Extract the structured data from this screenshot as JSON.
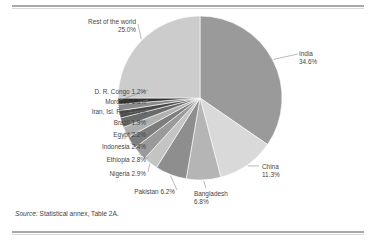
{
  "figure": {
    "source_prefix": "Source:",
    "source_text": " Statistical annex, Table 2A."
  },
  "chart_data": {
    "type": "pie",
    "title": "",
    "subtitle": "",
    "xlabel": "",
    "ylabel": "",
    "units": "percent",
    "legend_position": "none",
    "grid": false,
    "label_format": "{name} {value}%",
    "start_angle_deg": 0,
    "direction": "clockwise",
    "categories": [
      "India",
      "China",
      "Bangladesh",
      "Pakistan",
      "Nigeria",
      "Ethiopia",
      "Indonesia",
      "Egypt",
      "Brazil",
      "Iran, Isl. Rep.",
      "Morocco",
      "D. R. Congo",
      "Rest of the world"
    ],
    "values": [
      34.6,
      11.3,
      6.8,
      6.2,
      2.9,
      2.8,
      2.4,
      2.2,
      1.9,
      1.4,
      1.3,
      1.2,
      25.0
    ],
    "colors": [
      "#9a9a9a",
      "#d9d9d9",
      "#b5b5b5",
      "#8e8e8e",
      "#c4c4c4",
      "#9a9a9a",
      "#7d7d7d",
      "#b0b0b0",
      "#6a6a6a",
      "#4a4a4a",
      "#8a8a8a",
      "#2e2e2e",
      "#cccccc"
    ],
    "slice_labels": [
      {
        "name": "India",
        "value": "34.6%",
        "line1": "India",
        "line2": "34.6%"
      },
      {
        "name": "China",
        "value": "11.3%",
        "line1": "China",
        "line2": "11.3%"
      },
      {
        "name": "Bangladesh",
        "value": "6.8%",
        "line1": "Bangladesh",
        "line2": "6.8%"
      },
      {
        "name": "Pakistan",
        "value": "6.2%",
        "line1": "Pakistan 6.2%",
        "line2": ""
      },
      {
        "name": "Nigeria",
        "value": "2.9%",
        "line1": "Nigeria 2.9%",
        "line2": ""
      },
      {
        "name": "Ethiopia",
        "value": "2.8%",
        "line1": "Ethiopia 2.8%",
        "line2": ""
      },
      {
        "name": "Indonesia",
        "value": "2.4%",
        "line1": "Indonesia 2.4%",
        "line2": ""
      },
      {
        "name": "Egypt",
        "value": "2.2%",
        "line1": "Egypt 2.2%",
        "line2": ""
      },
      {
        "name": "Brazil",
        "value": "1.9%",
        "line1": "Brazil 1.9%",
        "line2": ""
      },
      {
        "name": "Iran, Isl. Rep.",
        "value": "1.4%",
        "line1": "Iran, Isl. Rep. 1.4%",
        "line2": ""
      },
      {
        "name": "Morocco",
        "value": "1.3%",
        "line1": "Morocco 1.3%",
        "line2": ""
      },
      {
        "name": "D. R. Congo",
        "value": "1.2%",
        "line1": "D. R. Congo 1.2%",
        "line2": ""
      },
      {
        "name": "Rest of the world",
        "value": "25.0%",
        "line1": "Rest of the world",
        "line2": "25.0%"
      }
    ]
  }
}
